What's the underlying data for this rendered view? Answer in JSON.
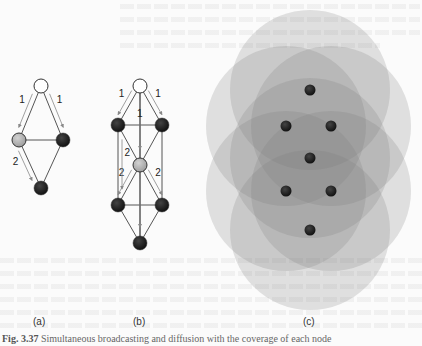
{
  "figure": {
    "caption_label": "Fig. 3.37",
    "caption_text": "Simultaneous broadcasting and diffusion with the coverage of each node",
    "panels": [
      {
        "id": "a",
        "label": "(a)",
        "nodes": [
          {
            "name": "source",
            "state": "white",
            "x": 41,
            "y": 86
          },
          {
            "name": "mid-left",
            "state": "gray",
            "x": 19,
            "y": 140
          },
          {
            "name": "mid-right",
            "state": "black",
            "x": 63,
            "y": 140
          },
          {
            "name": "bottom",
            "state": "black",
            "x": 41,
            "y": 188
          }
        ],
        "edges": [
          [
            0,
            1
          ],
          [
            0,
            2
          ],
          [
            1,
            2
          ],
          [
            1,
            3
          ],
          [
            2,
            3
          ]
        ],
        "arrows": [
          {
            "from": 0,
            "to": 1,
            "label": "1",
            "side": "left"
          },
          {
            "from": 0,
            "to": 2,
            "label": "1",
            "side": "right"
          },
          {
            "from": 1,
            "to": 3,
            "label": "2",
            "side": "left"
          }
        ]
      },
      {
        "id": "b",
        "label": "(b)",
        "nodes": [
          {
            "name": "source",
            "state": "white",
            "x": 140,
            "y": 86
          },
          {
            "name": "row1-left",
            "state": "black",
            "x": 118,
            "y": 125
          },
          {
            "name": "row1-right",
            "state": "black",
            "x": 162,
            "y": 125
          },
          {
            "name": "center",
            "state": "gray",
            "x": 140,
            "y": 165
          },
          {
            "name": "row3-left",
            "state": "black",
            "x": 118,
            "y": 205
          },
          {
            "name": "row3-right",
            "state": "black",
            "x": 162,
            "y": 205
          },
          {
            "name": "bottom",
            "state": "black",
            "x": 140,
            "y": 243
          }
        ],
        "edges": [
          [
            0,
            1
          ],
          [
            0,
            2
          ],
          [
            0,
            3
          ],
          [
            1,
            2
          ],
          [
            1,
            3
          ],
          [
            2,
            3
          ],
          [
            1,
            4
          ],
          [
            2,
            5
          ],
          [
            3,
            4
          ],
          [
            3,
            5
          ],
          [
            4,
            5
          ],
          [
            3,
            6
          ],
          [
            4,
            6
          ],
          [
            5,
            6
          ],
          [
            0,
            6
          ]
        ],
        "arrows": [
          {
            "from": 0,
            "to": 1,
            "label": "1",
            "side": "left"
          },
          {
            "from": 0,
            "to": 2,
            "label": "1",
            "side": "right"
          },
          {
            "from": 0,
            "to": 3,
            "label": "1",
            "side": "center"
          },
          {
            "from": 3,
            "to": 4,
            "label": "2",
            "side": "left"
          },
          {
            "from": 3,
            "to": 5,
            "label": "2",
            "side": "right"
          },
          {
            "from": 1,
            "to": 4,
            "label": "2",
            "side": "inner"
          },
          {
            "from": 3,
            "to": 6,
            "label": "",
            "side": "center"
          }
        ]
      },
      {
        "id": "c",
        "label": "(c)",
        "nodes": [
          {
            "x": 310,
            "y": 90
          },
          {
            "x": 286,
            "y": 126
          },
          {
            "x": 331,
            "y": 126
          },
          {
            "x": 310,
            "y": 158
          },
          {
            "x": 286,
            "y": 191
          },
          {
            "x": 331,
            "y": 191
          },
          {
            "x": 310,
            "y": 230
          }
        ]
      }
    ]
  },
  "colors": {
    "white_node": "#ffffff",
    "gray_node": "#b8b8b8",
    "black_node": "#1a1a1a",
    "edge": "#555555",
    "arrow": "#888888",
    "coverage": "#7a7a7a"
  }
}
